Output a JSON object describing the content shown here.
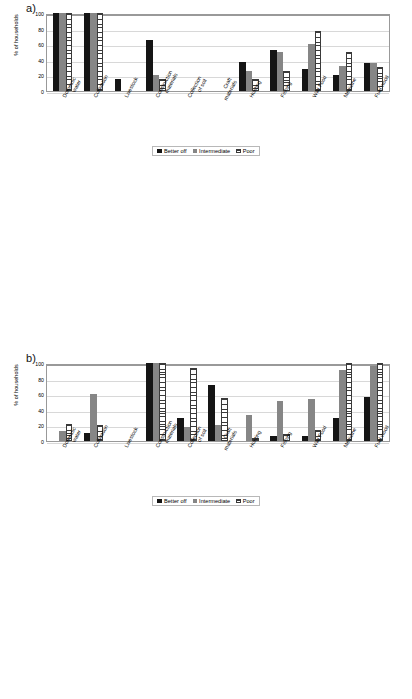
{
  "figure": {
    "ylabel": "% of households",
    "yticks": [
      "100",
      "80",
      "60",
      "40",
      "20",
      "0"
    ],
    "legend": [
      "Better off",
      "Intermediate",
      "Poor"
    ],
    "panel_labels": [
      "a)",
      "b)",
      "c)",
      "d)"
    ]
  },
  "chart_data": [
    {
      "type": "bar",
      "title": "a)",
      "xlabel": "",
      "ylabel": "% of households",
      "ylim": [
        0,
        100
      ],
      "grid": true,
      "legend_position": "bottom",
      "categories": [
        "Domestic water",
        "Cultivation",
        "Livestock",
        "Construction materials",
        "Collection of soil",
        "Craft materials",
        "Hunting",
        "Fishing",
        "Wild Food",
        "Medicine",
        "Fuel wood"
      ],
      "series": [
        {
          "name": "Better off",
          "values": [
            100,
            100,
            16,
            65,
            0,
            0,
            37,
            53,
            28,
            21,
            36
          ]
        },
        {
          "name": "Intermediate",
          "values": [
            100,
            100,
            0,
            21,
            0,
            0,
            26,
            50,
            60,
            32,
            36
          ]
        },
        {
          "name": "Poor",
          "values": [
            100,
            100,
            0,
            16,
            0,
            0,
            15,
            26,
            77,
            50,
            31
          ]
        }
      ]
    },
    {
      "type": "bar",
      "title": "b)",
      "xlabel": "",
      "ylabel": "% of households",
      "ylim": [
        0,
        100
      ],
      "grid": true,
      "legend_position": "bottom",
      "categories": [
        "Domestic water",
        "Cultivation",
        "Livestock",
        "Construction materials",
        "Collection of soil",
        "Craft materials",
        "Hunting",
        "Fishing",
        "Wild Food",
        "Medicine",
        "Fuel wood"
      ],
      "series": [
        {
          "name": "Better off",
          "values": [
            0,
            10,
            0,
            100,
            29,
            72,
            0,
            7,
            7,
            29,
            56
          ]
        },
        {
          "name": "Intermediate",
          "values": [
            13,
            60,
            0,
            100,
            18,
            21,
            33,
            51,
            54,
            91,
            96
          ]
        },
        {
          "name": "Poor",
          "values": [
            22,
            21,
            0,
            100,
            93,
            55,
            4,
            9,
            14,
            100,
            100
          ]
        }
      ]
    },
    {
      "type": "bar",
      "title": "c)",
      "xlabel": "",
      "ylabel": "% of households",
      "ylim": [
        0,
        100
      ],
      "grid": true,
      "legend_position": "bottom",
      "categories": [
        "Domestic water",
        "Cultivation",
        "Livestock",
        "Construction materials",
        "Collection of soil",
        "Craft material",
        "Hunting",
        "Fishing",
        "Wild Food",
        "Medicine",
        "Fuel wood"
      ],
      "series": [
        {
          "name": "Better off",
          "values": [
            60,
            100,
            15,
            61,
            0,
            0,
            0,
            15,
            21,
            0,
            46
          ]
        },
        {
          "name": "Intermediate",
          "values": [
            61,
            100,
            0,
            86,
            0,
            0,
            0,
            25,
            31,
            0,
            66
          ]
        },
        {
          "name": "Poor",
          "values": [
            76,
            100,
            0,
            91,
            0,
            0,
            0,
            26,
            31,
            0,
            57
          ]
        }
      ]
    },
    {
      "type": "bar",
      "title": "d)",
      "xlabel": "",
      "ylabel": "% of households",
      "ylim": [
        0,
        100
      ],
      "grid": true,
      "legend_position": "bottom",
      "categories": [
        "Domestic water",
        "Cultivation",
        "Livestock",
        "Construction materials",
        "Collection of soil",
        "Craft material",
        "Hunting",
        "Fishing",
        "Wild Food",
        "Medicine",
        "Fuel wood"
      ],
      "series": [
        {
          "name": "Better off",
          "values": [
            47,
            84,
            80,
            16,
            0,
            16,
            0,
            0,
            42,
            17,
            48
          ]
        },
        {
          "name": "Intermediate",
          "values": [
            66,
            89,
            53,
            29,
            0,
            18,
            0,
            0,
            72,
            18,
            67
          ]
        },
        {
          "name": "Poor",
          "values": [
            63,
            76,
            25,
            33,
            0,
            30,
            30,
            30,
            64,
            18,
            84
          ]
        }
      ]
    }
  ]
}
